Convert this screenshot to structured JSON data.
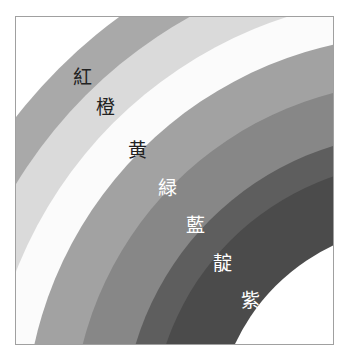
{
  "diagram": {
    "title": "",
    "center": [
      420,
      430
    ],
    "bands": [
      {
        "name": "red",
        "label": "紅",
        "outer_r": 511,
        "color": "#a9a9a9",
        "text_color": "#222222",
        "label_pos": [
          82,
          77
        ]
      },
      {
        "name": "orange",
        "label": "橙",
        "outer_r": 473,
        "color": "#dadada",
        "text_color": "#222222",
        "label_pos": [
          105,
          107
        ]
      },
      {
        "name": "yellow",
        "label": "黄",
        "outer_r": 434,
        "color": "#fbfbfb",
        "text_color": "#222222",
        "label_pos": [
          137,
          150
        ]
      },
      {
        "name": "green",
        "label": "緑",
        "outer_r": 395,
        "color": "#a2a2a2",
        "text_color": "#ffffff",
        "label_pos": [
          167,
          188
        ]
      },
      {
        "name": "blue",
        "label": "藍",
        "outer_r": 348,
        "color": "#878787",
        "text_color": "#ffffff",
        "label_pos": [
          195,
          225
        ]
      },
      {
        "name": "indigo",
        "label": "靛",
        "outer_r": 297,
        "color": "#5e5e5e",
        "text_color": "#ffffff",
        "label_pos": [
          222,
          263
        ]
      },
      {
        "name": "violet",
        "label": "紫",
        "outer_r": 268,
        "color": "#4b4b4b",
        "text_color": "#ffffff",
        "label_pos": [
          250,
          300
        ]
      }
    ],
    "inner_r": 204,
    "inner_color": "#ffffff"
  }
}
